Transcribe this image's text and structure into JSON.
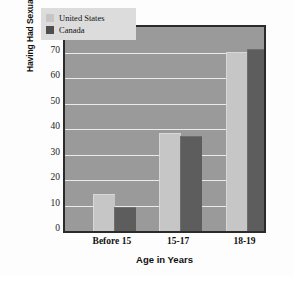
{
  "chart_data": {
    "type": "bar",
    "title": "",
    "xlabel": "Age in Years",
    "ylabel": "Percentage of Adolescent Girls Having Had Sexual Intercourse",
    "ylabel_lines": [
      "Percentage of Adolescent Girls",
      "Having Had Sexual Intercourse"
    ],
    "categories": [
      "Before 15",
      "15-17",
      "18-19"
    ],
    "series": [
      {
        "name": "United States",
        "values": [
          14,
          38,
          70
        ],
        "color": "#c6c6c6"
      },
      {
        "name": "Canada",
        "values": [
          9,
          37,
          71
        ],
        "color": "#5d5d5d"
      }
    ],
    "ylim": [
      0,
      80
    ],
    "yticks": [
      0,
      10,
      20,
      30,
      40,
      50,
      60,
      70,
      80
    ],
    "ytick_labels": [
      "0",
      "10",
      "20",
      "30",
      "40",
      "50",
      "60",
      "70",
      "80"
    ],
    "grid": true,
    "grid_axis": "y",
    "legend_position": "top-left",
    "plot_background": "#9a9a9a",
    "gridline_color": "#eaeaea",
    "axis_border_color": "#2b2b2b",
    "figure_background": "#fdfdfd"
  },
  "legend": {
    "entries": [
      {
        "label": "United States",
        "swatch": "us"
      },
      {
        "label": "Canada",
        "swatch": "ca"
      }
    ]
  },
  "axis": {
    "x_title": "Age in Years"
  },
  "caption": {
    "marker": "triangle-marker",
    "bar": ""
  }
}
